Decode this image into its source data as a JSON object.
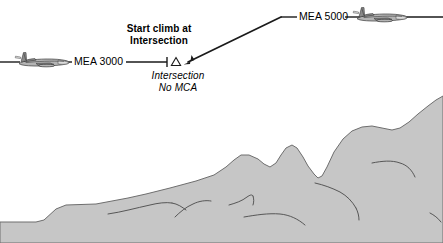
{
  "diagram": {
    "type": "enroute-altitude-profile",
    "colors": {
      "terrain_fill": "#c6c6c6",
      "terrain_outline": "#6e6e6e",
      "line": "#1a1a1a",
      "background": "#ffffff"
    },
    "labels": {
      "mea_low": "MEA 3000",
      "mea_high": "MEA 5000",
      "callout_line1": "Start climb at",
      "callout_line2": "Intersection",
      "intersection_line1": "Intersection",
      "intersection_line2": "No MCA"
    },
    "icons": {
      "aircraft_low": "airplane-icon",
      "aircraft_high": "airplane-icon",
      "intersection": "intersection-triangle-icon",
      "climb_arrow": "arrow-head-icon"
    },
    "altitudes": {
      "low_mea_ft": 3000,
      "high_mea_ft": 5000
    }
  }
}
